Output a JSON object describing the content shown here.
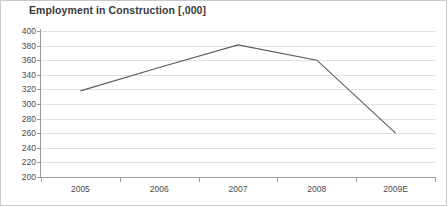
{
  "chart_data": {
    "type": "line",
    "title": "Employment in Construction [,000]",
    "xlabel": "",
    "ylabel": "",
    "categories": [
      "2005",
      "2006",
      "2007",
      "2008",
      "2009E"
    ],
    "values": [
      318,
      350,
      381,
      360,
      260
    ],
    "series": [
      {
        "name": "Employment in Construction",
        "values": [
          318,
          350,
          381,
          360,
          260
        ],
        "color": "#595959"
      }
    ],
    "ylim": [
      200,
      400
    ],
    "ytick_step": 20,
    "ytick_labels": [
      "400",
      "380",
      "360",
      "340",
      "320",
      "300",
      "280",
      "260",
      "240",
      "220",
      "200"
    ],
    "ytick_values": [
      400,
      380,
      360,
      340,
      320,
      300,
      280,
      260,
      240,
      220,
      200
    ],
    "grid": true,
    "grid_axis": "y",
    "legend": false,
    "legend_position": "none",
    "markers": false,
    "annotations": []
  },
  "colors": {
    "line": "#595959",
    "grid": "#e2e2e2",
    "axis": "#9a9a9a",
    "title_text": "#3a3a3a",
    "tick_text": "#4a4a4a",
    "border": "#c9c9c9",
    "background": "#ffffff"
  }
}
